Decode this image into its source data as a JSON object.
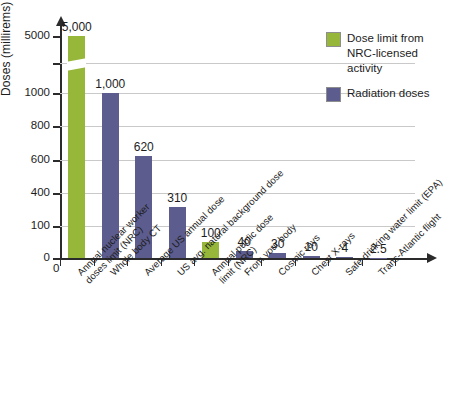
{
  "chart_data": {
    "type": "bar",
    "title": "",
    "subtitle": "",
    "xlabel": "",
    "ylabel": "Doses (millirems)",
    "grid": true,
    "legend_position": "top-right",
    "y_axis_broken": true,
    "y_tick_labels": [
      "5000",
      "",
      "1000",
      "800",
      "600",
      "400",
      "100",
      "0"
    ],
    "ylim": [
      0,
      5000
    ],
    "categories": [
      "Annual nuclear worker doses limit (NRC)",
      "Whole body CT",
      "Average US annual dose",
      "US avg. natural background dose",
      "Annual public dose limit (NRC)",
      "From your body",
      "Cosmic rays",
      "Chest X-rays",
      "Safe drinking water limit (EPA)",
      "Trans-Atlantic flight"
    ],
    "categories_lines": [
      [
        "Annual nuclear worker",
        "doses limit (NRC)"
      ],
      [
        "Whole body CT"
      ],
      [
        "Average US annual dose"
      ],
      [
        "US avg. natural background dose"
      ],
      [
        "Annual public dose",
        "limit (NRC)"
      ],
      [
        "From your body"
      ],
      [
        "Cosmic rays"
      ],
      [
        "Chest X-rays"
      ],
      [
        "Safe drinking water limit (EPA)"
      ],
      [
        "Trans-Atlantic flight"
      ]
    ],
    "values": [
      5000,
      1000,
      620,
      310,
      100,
      40,
      30,
      10,
      4,
      2.5
    ],
    "value_labels": [
      "5,000",
      "1,000",
      "620",
      "310",
      "100",
      "40",
      "30",
      "10",
      "4",
      "2.5"
    ],
    "series": [
      {
        "name": "Dose limit from NRC-licensed activity",
        "color": "#97b73a",
        "members": [
          "Annual nuclear worker doses limit (NRC)",
          "Annual public dose limit (NRC)"
        ]
      },
      {
        "name": "Radiation doses",
        "color": "#5c5c8e",
        "members": [
          "Whole body CT",
          "Average US annual dose",
          "US avg. natural background dose",
          "From your body",
          "Cosmic rays",
          "Chest X-rays",
          "Safe drinking water limit (EPA)",
          "Trans-Atlantic flight"
        ]
      }
    ],
    "bar_colors": [
      "green",
      "purple",
      "purple",
      "purple",
      "green",
      "purple",
      "purple",
      "purple",
      "purple",
      "purple"
    ],
    "origin_label": "0"
  },
  "legend": {
    "items": [
      {
        "label": "Dose limit from NRC-licensed activity",
        "color": "#97b73a"
      },
      {
        "label": "Radiation doses",
        "color": "#5c5c8e"
      }
    ]
  },
  "axis": {
    "y_title": "Doses (millirems)",
    "origin": "0"
  }
}
